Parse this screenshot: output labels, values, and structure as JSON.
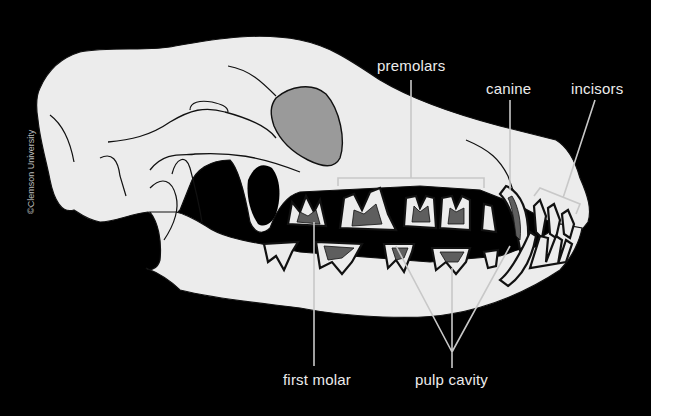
{
  "figure": {
    "credit": "©Clemson University",
    "colors": {
      "background": "#000000",
      "bone": "#ececec",
      "orbit": "#9a9a9a",
      "pulp": "#5e5e5e",
      "outline": "#111111",
      "leader": "#c8c8c8"
    },
    "labels": {
      "premolars": "premolars",
      "canine": "canine",
      "incisors": "incisors",
      "first_molar": "first molar",
      "pulp_cavity": "pulp cavity"
    }
  }
}
